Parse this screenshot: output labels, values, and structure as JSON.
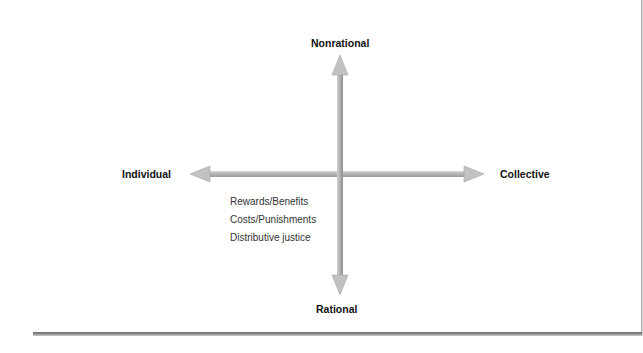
{
  "diagram": {
    "type": "quadrant-axes",
    "axes": {
      "top": "Nonrational",
      "bottom": "Rational",
      "left": "Individual",
      "right": "Collective"
    },
    "quadrant_items": {
      "lower_left": [
        "Rewards/Benefits",
        "Costs/Punishments",
        "Distributive justice"
      ]
    },
    "colors": {
      "arrow_fill": "#b8b8b8",
      "arrow_shade": "#8a8a8a",
      "label_text": "#111111",
      "item_text": "#333333"
    }
  }
}
